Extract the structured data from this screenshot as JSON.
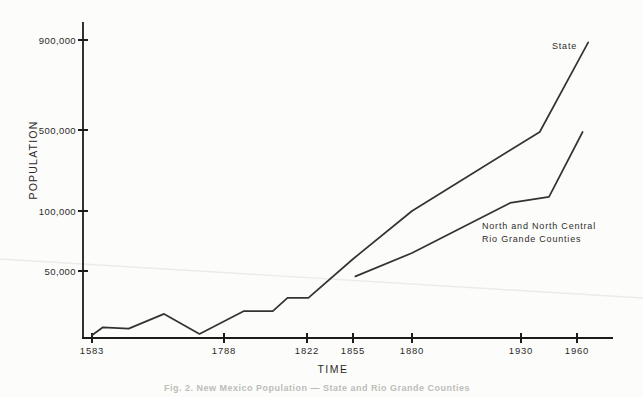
{
  "figure": {
    "caption": "Fig. 2.  New Mexico Population — State and Rio Grande Counties"
  },
  "chart_data": {
    "type": "line",
    "title": "",
    "xlabel": "TIME",
    "ylabel": "POPULATION",
    "x_ticks": [
      {
        "label": "1583",
        "year": 1583
      },
      {
        "label": "1788",
        "year": 1788
      },
      {
        "label": "1822",
        "year": 1822
      },
      {
        "label": "1855",
        "year": 1855
      },
      {
        "label": "1880",
        "year": 1880
      },
      {
        "label": "1930",
        "year": 1930
      },
      {
        "label": "1960",
        "year": 1960
      }
    ],
    "y_ticks": [
      {
        "label": "900,000",
        "value": 900000
      },
      {
        "label": "500,000",
        "value": 500000
      },
      {
        "label": "100,000",
        "value": 100000
      },
      {
        "label": "50,000",
        "value": 50000
      }
    ],
    "layout": {
      "x_scale": "irregular year spacing, piecewise between labeled ticks",
      "y_scale": "non-linear piecewise (compressed above 100,000)",
      "grid": false,
      "legend": "inline annotations next to lines"
    },
    "series": [
      {
        "name": "State",
        "annotation": "State",
        "points": [
          [
            1583,
            2000
          ],
          [
            1600,
            8000
          ],
          [
            1640,
            7000
          ],
          [
            1695,
            18000
          ],
          [
            1750,
            3000
          ],
          [
            1796,
            20000
          ],
          [
            1808,
            20000
          ],
          [
            1814,
            30000
          ],
          [
            1823,
            30000
          ],
          [
            1855,
            60000
          ],
          [
            1880,
            100000
          ],
          [
            1940,
            490000
          ],
          [
            1966,
            890000
          ]
        ]
      },
      {
        "name": "North and North Central Rio Grande Counties",
        "annotation_lines": [
          "North and North Central",
          "Rio Grande Counties"
        ],
        "points": [
          [
            1856,
            46000
          ],
          [
            1880,
            65000
          ],
          [
            1925,
            140000
          ],
          [
            1945,
            170000
          ],
          [
            1963,
            490000
          ]
        ]
      }
    ],
    "colors": {
      "line": "#333333",
      "axis": "#1c1c1c",
      "text": "#2b2b2b",
      "faint_artifact": "#ebebe7"
    }
  }
}
